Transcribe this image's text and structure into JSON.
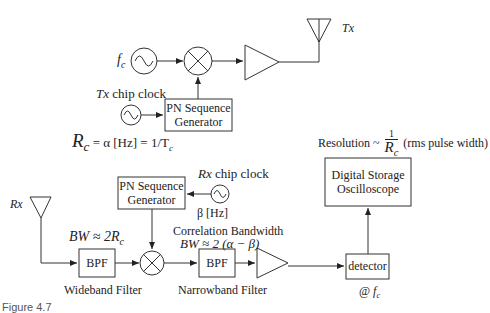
{
  "figure": {
    "caption": "Figure 4.7",
    "colors": {
      "stroke": "#333333",
      "text": "#222222",
      "background": "#ffffff"
    }
  },
  "transmitter": {
    "carrier_label": "f",
    "carrier_sub": "c",
    "chip_clock_label_prefix": "Tx",
    "chip_clock_label": " chip clock",
    "pn_generator_line1": "PN Sequence",
    "pn_generator_line2": "Generator",
    "antenna_label": "Tx",
    "chip_rate_equation": "R",
    "chip_rate_sub": "c",
    "chip_rate_rest": " = α [Hz] = 1/T",
    "chip_rate_rest_sub": "c"
  },
  "receiver": {
    "antenna_label": "Rx",
    "chip_clock_label_prefix": "Rx",
    "chip_clock_label": " chip clock",
    "chip_clock_freq": "β [Hz]",
    "pn_generator_line1": "PN Sequence",
    "pn_generator_line2": "Generator",
    "wideband_bw": "BW ≈ 2R",
    "wideband_bw_sub": "c",
    "bpf1_label": "BPF",
    "bpf1_caption": "Wideband Filter",
    "correlation_title": "Correlation Bandwidth",
    "correlation_bw": "BW ≈ 2 (α − β)",
    "bpf2_label": "BPF",
    "bpf2_caption": "Narrowband Filter",
    "detector_label": "detector",
    "detector_caption_prefix": "@ ",
    "detector_caption_f": "f",
    "detector_caption_sub": "c",
    "dso_line1": "Digital Storage",
    "dso_line2": "Oscilloscope",
    "resolution_prefix": "Resolution ~",
    "resolution_num": "1",
    "resolution_den": "R",
    "resolution_den_sub": "c",
    "resolution_suffix": "(rms pulse width)"
  }
}
